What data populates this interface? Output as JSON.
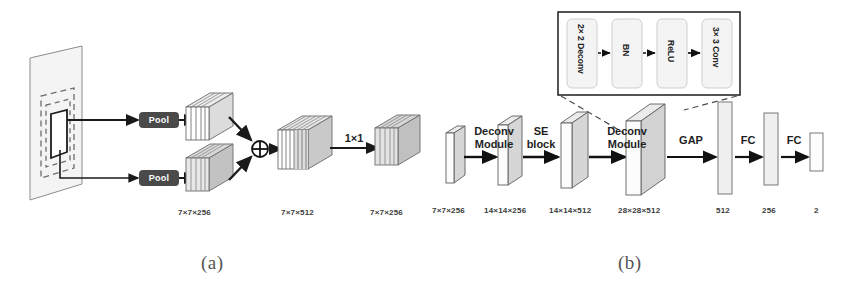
{
  "figure": {
    "captions": [
      {
        "id": "a",
        "text": "(a)"
      },
      {
        "id": "b",
        "text": "(b)"
      }
    ]
  },
  "panel_a": {
    "name": "multi-scale-pooling-fusion",
    "pool_blocks": [
      {
        "label": "Pool"
      },
      {
        "label": "Pool"
      }
    ],
    "merge_symbol": "⊕",
    "conv_label": "1×1",
    "dim_labels": [
      {
        "text": "7×7×256"
      },
      {
        "text": "7×7×512"
      },
      {
        "text": "7×7×256"
      }
    ]
  },
  "panel_b": {
    "name": "deconv-se-classification-network",
    "stage_labels": [
      {
        "line1": "Deconv",
        "line2": "Module"
      },
      {
        "line1": "SE",
        "line2": "block"
      },
      {
        "line1": "Deconv",
        "line2": "Module"
      },
      {
        "line1": "GAP",
        "line2": ""
      },
      {
        "line1": "FC",
        "line2": ""
      },
      {
        "line1": "FC",
        "line2": ""
      }
    ],
    "dim_labels": [
      {
        "text": "7×7×256"
      },
      {
        "text": "14×14×256"
      },
      {
        "text": "14×14×512"
      },
      {
        "text": "28×28×512"
      },
      {
        "text": "512"
      },
      {
        "text": "256"
      },
      {
        "text": "2"
      }
    ],
    "inset": {
      "name": "deconv-module-detail",
      "steps": [
        {
          "text": "2× 2 Deconv"
        },
        {
          "text": "BN"
        },
        {
          "text": "ReLU"
        },
        {
          "text": "3× 3 Conv"
        }
      ]
    }
  }
}
